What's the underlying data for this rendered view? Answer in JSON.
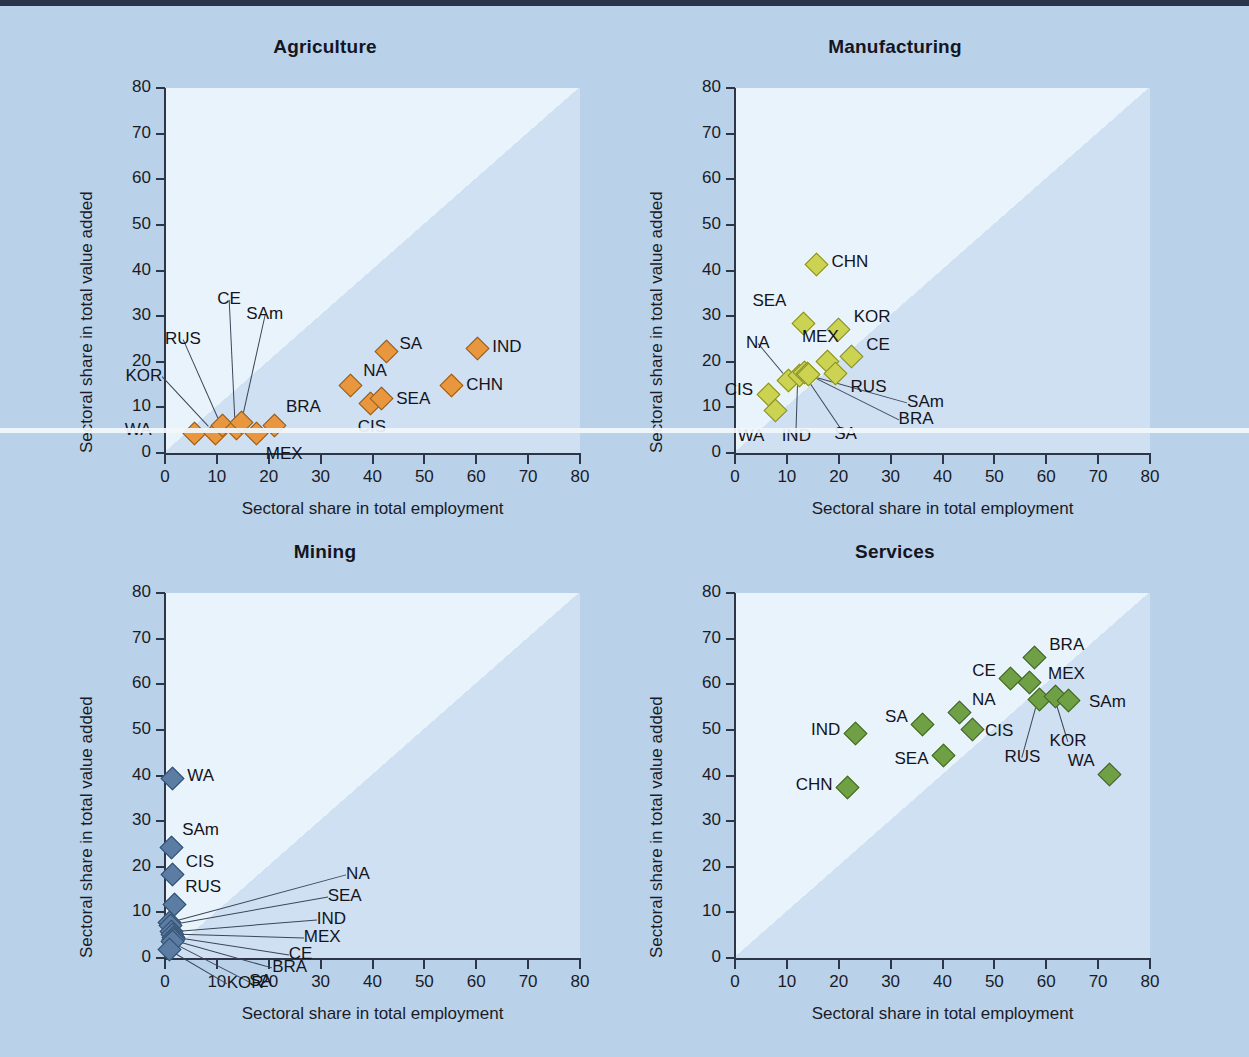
{
  "figure": {
    "axis_x_title": "Sectoral share in total employment",
    "axis_y_title": "Sectoral share in total value added",
    "tick_labels": [
      "0",
      "10",
      "20",
      "30",
      "40",
      "50",
      "60",
      "70",
      "80"
    ],
    "axis_min": 0,
    "axis_max": 80,
    "axis_step": 10,
    "background_color": "#b9d2ea",
    "plot_background_color": "#e9f3fb",
    "diagonal_shade_color": "#cfe0f2"
  },
  "chart_data": [
    {
      "type": "scatter",
      "title": "Agriculture",
      "xlabel": "Sectoral share in total employment",
      "ylabel": "Sectoral share in total value added",
      "xlim": [
        0,
        80
      ],
      "ylim": [
        0,
        80
      ],
      "grid": false,
      "legend": "none",
      "marker_color": "#e8973f",
      "annotation": "Shaded triangle marks the region below the 45-degree line (value-added share < employment share).",
      "points": [
        {
          "label": "WA",
          "x": 5.5,
          "y": 4.5
        },
        {
          "label": "KOR",
          "x": 9.5,
          "y": 4.5
        },
        {
          "label": "RUS",
          "x": 10.8,
          "y": 6.2
        },
        {
          "label": "CE",
          "x": 13.5,
          "y": 5.6
        },
        {
          "label": "SAm",
          "x": 14.6,
          "y": 6.8
        },
        {
          "label": "MEX",
          "x": 17.5,
          "y": 4.5
        },
        {
          "label": "BRA",
          "x": 21.0,
          "y": 6.2
        },
        {
          "label": "NA",
          "x": 35.5,
          "y": 15.0
        },
        {
          "label": "CIS",
          "x": 39.5,
          "y": 11.0
        },
        {
          "label": "SEA",
          "x": 41.5,
          "y": 12.2
        },
        {
          "label": "SA",
          "x": 42.5,
          "y": 22.5
        },
        {
          "label": "CHN",
          "x": 55.0,
          "y": 15.0
        },
        {
          "label": "IND",
          "x": 60.0,
          "y": 23.2
        }
      ]
    },
    {
      "type": "scatter",
      "title": "Manufacturing",
      "xlabel": "Sectoral share in total employment",
      "ylabel": "Sectoral share in total value added",
      "xlim": [
        0,
        80
      ],
      "ylim": [
        0,
        80
      ],
      "grid": false,
      "legend": "none",
      "marker_color": "#ccd352",
      "annotation": "Shaded triangle marks the region below the 45-degree line (value-added share < employment share).",
      "points": [
        {
          "label": "CIS",
          "x": 6.2,
          "y": 13.0
        },
        {
          "label": "WA",
          "x": 7.6,
          "y": 9.5
        },
        {
          "label": "NA",
          "x": 10.2,
          "y": 16.2
        },
        {
          "label": "IND",
          "x": 12.2,
          "y": 17.3
        },
        {
          "label": "SA",
          "x": 13.2,
          "y": 17.8
        },
        {
          "label": "BRA",
          "x": 13.8,
          "y": 17.6
        },
        {
          "label": "SEA",
          "x": 13.0,
          "y": 28.5
        },
        {
          "label": "CHN",
          "x": 15.5,
          "y": 41.5
        },
        {
          "label": "MEX",
          "x": 17.6,
          "y": 20.2
        },
        {
          "label": "RUS",
          "x": 19.2,
          "y": 17.6
        },
        {
          "label": "KOR",
          "x": 19.8,
          "y": 27.2
        },
        {
          "label": "CE",
          "x": 22.2,
          "y": 21.4
        },
        {
          "label": "SAm",
          "x": 13.9,
          "y": 17.4
        }
      ]
    },
    {
      "type": "scatter",
      "title": "Mining",
      "xlabel": "Sectoral share in total employment",
      "ylabel": "Sectoral share in total value added",
      "xlim": [
        0,
        80
      ],
      "ylim": [
        0,
        80
      ],
      "grid": false,
      "legend": "none",
      "marker_color": "#5b7da3",
      "annotation": "Shaded triangle marks the region below the 45-degree line (value-added share < employment share).",
      "points": [
        {
          "label": "WA",
          "x": 1.2,
          "y": 39.5
        },
        {
          "label": "SAm",
          "x": 1.0,
          "y": 24.5
        },
        {
          "label": "CIS",
          "x": 1.3,
          "y": 18.5
        },
        {
          "label": "RUS",
          "x": 1.6,
          "y": 12.0
        },
        {
          "label": "NA",
          "x": 0.6,
          "y": 8.0
        },
        {
          "label": "SEA",
          "x": 0.9,
          "y": 7.4
        },
        {
          "label": "IND",
          "x": 1.1,
          "y": 6.0
        },
        {
          "label": "MEX",
          "x": 1.3,
          "y": 5.4
        },
        {
          "label": "CE",
          "x": 1.5,
          "y": 4.8
        },
        {
          "label": "BRA",
          "x": 1.4,
          "y": 4.2
        },
        {
          "label": "SA",
          "x": 1.2,
          "y": 3.8
        },
        {
          "label": "KOR",
          "x": 0.7,
          "y": 2.0
        }
      ]
    },
    {
      "type": "scatter",
      "title": "Services",
      "xlabel": "Sectoral share in total employment",
      "ylabel": "Sectoral share in total value added",
      "xlim": [
        0,
        80
      ],
      "ylim": [
        0,
        80
      ],
      "grid": false,
      "legend": "none",
      "marker_color": "#6fa045",
      "annotation": "Shaded triangle marks the region below the 45-degree line (value-added share < employment share).",
      "points": [
        {
          "label": "CHN",
          "x": 21.5,
          "y": 37.5
        },
        {
          "label": "IND",
          "x": 23.0,
          "y": 49.5
        },
        {
          "label": "SA",
          "x": 36.0,
          "y": 51.5
        },
        {
          "label": "SEA",
          "x": 40.0,
          "y": 44.5
        },
        {
          "label": "NA",
          "x": 43.0,
          "y": 54.0
        },
        {
          "label": "CIS",
          "x": 45.5,
          "y": 50.2
        },
        {
          "label": "CE",
          "x": 53.0,
          "y": 61.5
        },
        {
          "label": "MEX",
          "x": 56.5,
          "y": 60.5
        },
        {
          "label": "BRA",
          "x": 57.5,
          "y": 66.0
        },
        {
          "label": "RUS",
          "x": 58.5,
          "y": 56.8
        },
        {
          "label": "KOR",
          "x": 61.5,
          "y": 57.6
        },
        {
          "label": "SAm",
          "x": 64.0,
          "y": 56.6
        },
        {
          "label": "WA",
          "x": 72.0,
          "y": 40.5
        }
      ]
    }
  ],
  "panel_label_placement": [
    {
      "panel": "Agriculture",
      "labels": [
        {
          "text": "WA",
          "px": 38,
          "py": 322,
          "leader": null
        },
        {
          "text": "KOR",
          "px": 28,
          "py": 272,
          "leader": {
            "x1": 52,
            "y1": 286,
            "x2": 77,
            "y2": 327
          }
        },
        {
          "text": "RUS",
          "px": 78,
          "py": 238,
          "leader": {
            "x1": 95,
            "y1": 252,
            "x2": 96,
            "y2": 318
          }
        },
        {
          "text": "CE",
          "px": 122,
          "py": 188,
          "leader": {
            "x1": 130,
            "y1": 202,
            "x2": 112,
            "y2": 322
          }
        },
        {
          "text": "SAm",
          "px": 152,
          "py": 212,
          "leader": {
            "x1": 160,
            "y1": 226,
            "x2": 125,
            "y2": 317
          }
        },
        {
          "text": "MEX",
          "px": 130,
          "py": 345,
          "leader": null
        },
        {
          "text": "BRA",
          "px": 148,
          "py": 300,
          "leader": null
        },
        {
          "text": "NA",
          "px": 200,
          "py": 253,
          "leader": null
        },
        {
          "text": "CIS",
          "px": 212,
          "py": 306,
          "leader": null
        },
        {
          "text": "SEA",
          "px": 252,
          "py": 282,
          "leader": null
        },
        {
          "text": "SA",
          "px": 247,
          "py": 226,
          "leader": null
        },
        {
          "text": "CHN",
          "px": 310,
          "py": 260,
          "leader": null
        },
        {
          "text": "IND",
          "px": 337,
          "py": 224,
          "leader": null
        }
      ]
    }
  ]
}
